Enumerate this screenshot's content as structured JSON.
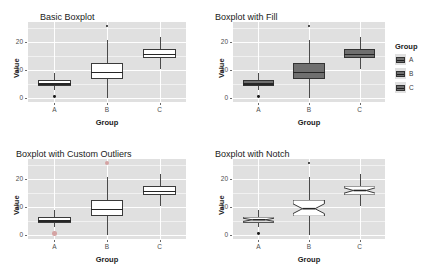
{
  "figure": {
    "layout": "2x2 grid of boxplot panels",
    "background": "#ffffff",
    "panel_background": "#e0e0e0",
    "gridline_color": "#ffffff"
  },
  "legend": {
    "title": "Group",
    "position": "right of top-right panel",
    "items": [
      {
        "label": "A",
        "color": "#6f6f6f"
      },
      {
        "label": "B",
        "color": "#6f6f6f"
      },
      {
        "label": "C",
        "color": "#6f6f6f"
      }
    ]
  },
  "chart_data": [
    {
      "type": "box",
      "title": "Basic Boxplot",
      "xlabel": "Group",
      "ylabel": "Value",
      "ylim": [
        -1.5,
        27
      ],
      "yticks": [
        0,
        10,
        20
      ],
      "categories": [
        "A",
        "B",
        "C"
      ],
      "grid": true,
      "style": "open boxes, white fill, black outline",
      "boxes": [
        {
          "group": "A",
          "min": 2.6,
          "q1": 4.3,
          "median": 5.2,
          "q3": 6.2,
          "max": 9.0,
          "outliers": [
            0.4
          ]
        },
        {
          "group": "B",
          "min": 0.0,
          "q1": 6.6,
          "median": 9.3,
          "q3": 12.4,
          "max": 20.7,
          "outliers": [
            25.6
          ]
        },
        {
          "group": "C",
          "min": 10.4,
          "q1": 14.1,
          "median": 15.7,
          "q3": 17.3,
          "max": 21.8,
          "outliers": []
        }
      ]
    },
    {
      "type": "box",
      "title": "Boxplot with Fill",
      "xlabel": "Group",
      "ylabel": "Value",
      "ylim": [
        -1.5,
        27
      ],
      "yticks": [
        0,
        10,
        20
      ],
      "categories": [
        "A",
        "B",
        "C"
      ],
      "grid": true,
      "style": "filled gray boxes mapped to Group",
      "boxes": [
        {
          "group": "A",
          "min": 2.6,
          "q1": 4.3,
          "median": 5.2,
          "q3": 6.2,
          "max": 9.0,
          "outliers": [
            0.4
          ]
        },
        {
          "group": "B",
          "min": 0.0,
          "q1": 6.6,
          "median": 9.3,
          "q3": 12.4,
          "max": 20.7,
          "outliers": [
            25.6
          ]
        },
        {
          "group": "C",
          "min": 10.4,
          "q1": 14.1,
          "median": 15.7,
          "q3": 17.3,
          "max": 21.8,
          "outliers": []
        }
      ]
    },
    {
      "type": "box",
      "title": "Boxplot with Custom Outliers",
      "xlabel": "Group",
      "ylabel": "Value",
      "ylim": [
        -1.5,
        27
      ],
      "yticks": [
        0,
        10,
        20
      ],
      "categories": [
        "A",
        "B",
        "C"
      ],
      "grid": true,
      "style": "open boxes with enlarged light-colored outlier markers",
      "boxes": [
        {
          "group": "A",
          "min": 2.6,
          "q1": 4.3,
          "median": 5.2,
          "q3": 6.2,
          "max": 9.0,
          "outliers": [
            0.4
          ]
        },
        {
          "group": "B",
          "min": 0.0,
          "q1": 6.6,
          "median": 9.3,
          "q3": 12.4,
          "max": 20.7,
          "outliers": [
            25.6
          ]
        },
        {
          "group": "C",
          "min": 10.4,
          "q1": 14.1,
          "median": 15.7,
          "q3": 17.3,
          "max": 21.8,
          "outliers": []
        }
      ]
    },
    {
      "type": "box",
      "title": "Boxplot with Notch",
      "xlabel": "Group",
      "ylabel": "Value",
      "ylim": [
        -1.5,
        27
      ],
      "yticks": [
        0,
        10,
        20
      ],
      "categories": [
        "A",
        "B",
        "C"
      ],
      "grid": true,
      "style": "notched boxes around the median",
      "boxes": [
        {
          "group": "A",
          "min": 2.6,
          "q1": 4.3,
          "median": 5.2,
          "q3": 6.2,
          "max": 9.0,
          "outliers": [
            0.4
          ]
        },
        {
          "group": "B",
          "min": 0.0,
          "q1": 6.6,
          "median": 9.3,
          "q3": 12.4,
          "max": 20.7,
          "outliers": [
            25.6
          ]
        },
        {
          "group": "C",
          "min": 10.4,
          "q1": 14.1,
          "median": 15.7,
          "q3": 17.3,
          "max": 21.8,
          "outliers": []
        }
      ]
    }
  ]
}
